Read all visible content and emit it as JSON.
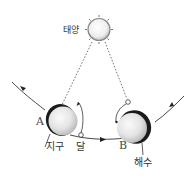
{
  "diagram": {
    "title": "",
    "labels": {
      "sun": "태양",
      "earth": "지구",
      "moon": "달",
      "tide": "해수",
      "position_a": "A",
      "position_b": "B"
    },
    "colors": {
      "line": "#333333",
      "dashed": "#555555",
      "sphere_light": "#f4f4f4",
      "sphere_mid": "#cfcfcf",
      "shadow": "#1a1a1a"
    },
    "elements": [
      {
        "id": "sun",
        "label": "태양",
        "shape": "spiky circle",
        "x": 96,
        "y": 30
      },
      {
        "id": "earth-a",
        "label": "A / 지구",
        "shape": "sphere with dark night side",
        "x": 60,
        "y": 120
      },
      {
        "id": "moon-a",
        "label": "달",
        "shape": "small circle",
        "x": 81,
        "y": 135
      },
      {
        "id": "earth-b",
        "label": "B / 해수",
        "shape": "sphere with dark side",
        "x": 133,
        "y": 127
      },
      {
        "id": "moon-b",
        "label": "",
        "shape": "small circle",
        "x": 128,
        "y": 102
      }
    ],
    "edges": [
      {
        "from": "sun",
        "to": "earth-a",
        "style": "dashed"
      },
      {
        "from": "sun",
        "to": "moon-b",
        "style": "dashed"
      },
      {
        "path": "orbit",
        "style": "solid with arrows",
        "direction": "left-to-right"
      }
    ]
  }
}
